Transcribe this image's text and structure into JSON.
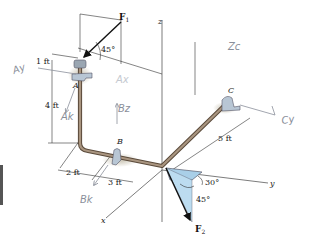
{
  "figure": {
    "axes": {
      "x": "x",
      "y": "y",
      "z": "z"
    },
    "supports": {
      "a": "A",
      "b": "B",
      "c": "C"
    },
    "forces": {
      "f1": {
        "symbol": "F",
        "subscript": "1",
        "angle": "45°"
      },
      "f2": {
        "symbol": "F",
        "subscript": "2",
        "angle_horizontal": "30°",
        "angle_vertical": "45°"
      }
    },
    "dimensions": {
      "top_offset": "1 ft",
      "vertical": "4 ft",
      "x_offset_a": "2 ft",
      "x_offset_b": "3 ft",
      "y_length": "5 ft"
    },
    "annotations": {
      "ay": "Ay",
      "ax": "Ax",
      "ak": "Ak",
      "bz": "Bz",
      "bk": "Bk",
      "cz": "Zc",
      "cy": "Cy"
    },
    "colors": {
      "pipe": "#8a7763",
      "bearing": "#b8c6d4",
      "f2_plane": "#a9cfe8"
    }
  }
}
